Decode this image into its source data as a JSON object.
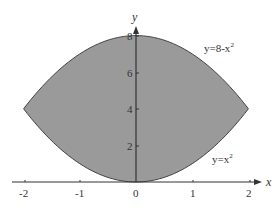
{
  "chart_data": {
    "type": "area",
    "title": "",
    "xlabel": "x",
    "ylabel": "y",
    "xlim": [
      -2.2,
      2.2
    ],
    "ylim": [
      0,
      8.5
    ],
    "grid": false,
    "legend": null,
    "x_ticks": [
      -2,
      -1,
      0,
      1,
      2
    ],
    "x_tick_labels": [
      "-2",
      "-1",
      "0",
      "1",
      "2"
    ],
    "y_ticks": [
      2,
      4,
      6,
      8
    ],
    "y_tick_labels": [
      "2",
      "4",
      "6",
      "8"
    ],
    "series": [
      {
        "name": "y=8-x²",
        "expression": "8 - x^2",
        "x": [
          -2,
          -1,
          0,
          1,
          2
        ],
        "values": [
          4,
          7,
          8,
          7,
          4
        ]
      },
      {
        "name": "y=x²",
        "expression": "x^2",
        "x": [
          -2,
          -1,
          0,
          1,
          2
        ],
        "values": [
          4,
          1,
          0,
          1,
          4
        ]
      }
    ],
    "shaded_region": {
      "between": [
        "y=x²",
        "y=8-x²"
      ],
      "x_range": [
        -2,
        2
      ],
      "fill": "#9a9a9a"
    },
    "annotations": [
      {
        "text": "y=8-x",
        "superscript": "2",
        "near": [
          1.75,
          7.2
        ]
      },
      {
        "text": "y=x",
        "superscript": "2",
        "near": [
          1.75,
          1.2
        ]
      }
    ]
  },
  "labels": {
    "x_axis": "x",
    "y_axis": "y",
    "upper_curve_base": "y=8-x",
    "upper_curve_sup": "2",
    "lower_curve_base": "y=x",
    "lower_curve_sup": "2",
    "x_ticks": [
      "-2",
      "-1",
      "0",
      "1",
      "2"
    ],
    "y_ticks": [
      "2",
      "4",
      "6",
      "8"
    ]
  },
  "colors": {
    "fill": "#9a9a9a",
    "curve": "#444444",
    "axis": "#333333",
    "background": "#ffffff"
  }
}
